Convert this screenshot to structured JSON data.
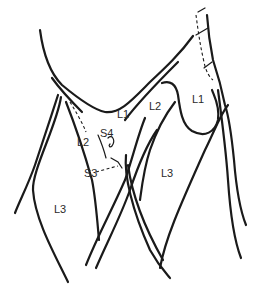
{
  "figure": {
    "type": "anatomical line drawing",
    "labels": [
      {
        "id": "l1-left",
        "text": "L1",
        "x": 117,
        "y": 109
      },
      {
        "id": "l1-right",
        "text": "L1",
        "x": 192,
        "y": 94
      },
      {
        "id": "l2-left",
        "text": "L2",
        "x": 77,
        "y": 137
      },
      {
        "id": "l2-right",
        "text": "L2",
        "x": 149,
        "y": 101
      },
      {
        "id": "s4",
        "text": "S4",
        "x": 100,
        "y": 128
      },
      {
        "id": "s3",
        "text": "S3",
        "x": 84,
        "y": 168
      },
      {
        "id": "l3-left",
        "text": "L3",
        "x": 54,
        "y": 204
      },
      {
        "id": "l3-right",
        "text": "L3",
        "x": 161,
        "y": 168
      }
    ],
    "colors": {
      "ink": "#1a1a1a",
      "background": "#ffffff"
    }
  }
}
